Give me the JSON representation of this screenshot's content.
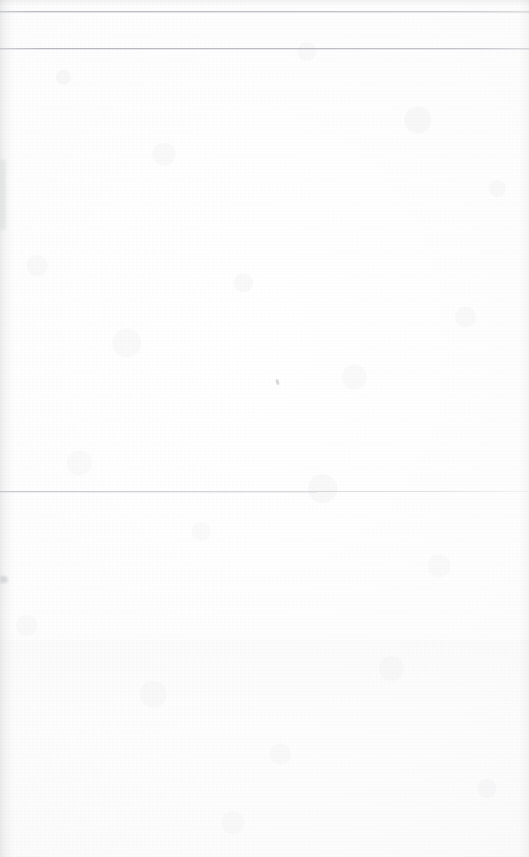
{
  "document": {
    "kind": "scanned-page",
    "description": "Blank scanned paper page",
    "page_width": 529,
    "page_height": 857,
    "background_color": "#fdfdfd",
    "text_content": "",
    "has_text": false
  },
  "rules": [
    {
      "name": "top-rule-1",
      "y": 11,
      "thickness": 1,
      "color": "#a8aab0",
      "span": "full-width"
    },
    {
      "name": "top-rule-2",
      "y": 48,
      "thickness": 1,
      "color": "#a4a6ac",
      "span": "full-width"
    },
    {
      "name": "mid-rule-3",
      "y": 491,
      "thickness": 1,
      "color": "#acaeb4",
      "span": "full-width"
    }
  ],
  "artifacts": [
    {
      "name": "scan-edge-left",
      "color": "#888a90",
      "position": "left-edge"
    },
    {
      "name": "scan-edge-right",
      "color": "#888a90",
      "position": "right-edge"
    },
    {
      "name": "speck-center",
      "x": 276,
      "y": 379,
      "color": "#96989e"
    },
    {
      "name": "speck-left-edge",
      "x": 0,
      "y": 576,
      "color": "#8c8e94"
    }
  ]
}
